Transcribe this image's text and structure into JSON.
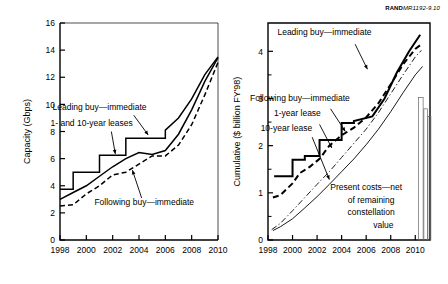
{
  "figure": {
    "credit_brand": "RAND",
    "credit_number": "MR1192-9.10"
  },
  "chart_data": [
    {
      "type": "line",
      "id": "capacity-chart",
      "title": "",
      "xlabel": "",
      "ylabel": "Capacity (Gbps)",
      "xlim": [
        1998,
        2010
      ],
      "ylim": [
        0,
        16
      ],
      "xticks": [
        1998,
        2000,
        2002,
        2004,
        2006,
        2008,
        2010
      ],
      "xtick_labels": [
        "1998",
        "2000",
        "2002",
        "2004",
        "2006",
        "2008",
        "2010"
      ],
      "yticks": [
        0,
        2,
        4,
        6,
        8,
        10,
        12,
        14,
        16
      ],
      "ytick_labels": [
        "0",
        "2",
        "4",
        "6",
        "8",
        "10",
        "12",
        "14",
        "16"
      ],
      "grid": false,
      "legend_position": "inline-annotations",
      "annotations": [
        {
          "text": "Leading buy—immediate",
          "x": 2001.0,
          "y": 9.6
        },
        {
          "text": "1- and 10-year leases",
          "x": 2000.4,
          "y": 8.4
        },
        {
          "text": "Following buy—immediate",
          "x": 2004.4,
          "y": 2.6
        }
      ],
      "series": [
        {
          "name": "Leading buy—immediate",
          "style": "solid-step",
          "x": [
            1998,
            1999,
            1999,
            2001,
            2001,
            2003,
            2003,
            2006,
            2006,
            2007,
            2008,
            2009,
            2010
          ],
          "values": [
            3.75,
            3.75,
            5.0,
            5.0,
            6.25,
            6.25,
            7.5,
            7.5,
            8.1,
            9.0,
            10.4,
            12.2,
            13.5
          ]
        },
        {
          "name": "1- and 10-year leases",
          "style": "solid-smooth",
          "x": [
            1998,
            1999,
            2000,
            2001,
            2002,
            2003,
            2004,
            2005,
            2006,
            2007,
            2008,
            2009,
            2010
          ],
          "values": [
            3.0,
            3.5,
            4.0,
            4.7,
            5.4,
            6.0,
            6.45,
            6.3,
            6.6,
            7.8,
            9.6,
            11.7,
            13.45
          ]
        },
        {
          "name": "Following buy—immediate",
          "style": "dashed-step",
          "x": [
            1998,
            1999,
            2000,
            2001,
            2002,
            2003,
            2003,
            2005,
            2005,
            2006,
            2007,
            2008,
            2009,
            2010
          ],
          "values": [
            2.5,
            2.6,
            3.4,
            4.0,
            4.8,
            5.0,
            5.0,
            6.2,
            6.2,
            6.2,
            7.0,
            8.5,
            10.7,
            13.1
          ]
        }
      ]
    },
    {
      "type": "line",
      "id": "cumulative-cost-chart",
      "title": "",
      "xlabel": "",
      "ylabel": "Cumulative ($ billion FY'98)",
      "xlim": [
        1998,
        2011.2
      ],
      "ylim": [
        0,
        4.6
      ],
      "xticks": [
        1998,
        2000,
        2002,
        2004,
        2006,
        2008,
        2010
      ],
      "xtick_labels": [
        "1998",
        "2000",
        "2002",
        "2004",
        "2006",
        "2008",
        "2010"
      ],
      "yticks": [
        0,
        1,
        2,
        3,
        4
      ],
      "ytick_labels": [
        "0",
        "1",
        "2",
        "3",
        "4"
      ],
      "yticks_minor": [
        0.5,
        1.5,
        2.5,
        3.5
      ],
      "grid": false,
      "legend_position": "inline-annotations",
      "annotations": [
        {
          "text": "Leading buy—immediate",
          "x": 2002.6,
          "y": 4.35
        },
        {
          "text": "Following buy—immediate",
          "x": 2000.6,
          "y": 2.95
        },
        {
          "text": "1-year lease",
          "x": 2000.4,
          "y": 2.62
        },
        {
          "text": "10-year lease",
          "x": 1999.5,
          "y": 2.32
        },
        {
          "text": "Present costs—net",
          "x": 2006.0,
          "y": 1.05
        },
        {
          "text": "of remaining",
          "x": 2006.4,
          "y": 0.78
        },
        {
          "text": "constellation",
          "x": 2006.4,
          "y": 0.52
        },
        {
          "text": "value",
          "x": 2007.4,
          "y": 0.26
        }
      ],
      "series": [
        {
          "name": "Leading buy—immediate",
          "style": "solid-thick-step",
          "x": [
            1998.5,
            2000,
            2000,
            2001,
            2001,
            2002.2,
            2002.2,
            2004,
            2004,
            2005,
            2005,
            2006.5,
            2007.5,
            2008.5,
            2009.5,
            2010.4
          ],
          "values": [
            1.35,
            1.35,
            1.7,
            1.7,
            1.78,
            1.78,
            2.12,
            2.12,
            2.48,
            2.48,
            2.52,
            2.62,
            3.0,
            3.55,
            4.0,
            4.35
          ]
        },
        {
          "name": "Following buy—immediate",
          "style": "dashed-thick",
          "x": [
            1998.4,
            1999,
            2000,
            2000.6,
            2001.4,
            2002.2,
            2003,
            2004,
            2005,
            2006,
            2007,
            2008,
            2009,
            2010,
            2010.5
          ],
          "values": [
            0.9,
            0.95,
            1.2,
            1.42,
            1.55,
            1.72,
            2.0,
            2.22,
            2.38,
            2.6,
            2.9,
            3.3,
            3.72,
            4.05,
            4.15
          ]
        },
        {
          "name": "1-year lease",
          "style": "dash-dot-thin",
          "x": [
            1998.3,
            1999,
            2000,
            2001,
            2002,
            2003,
            2004,
            2005,
            2006,
            2007,
            2008,
            2009,
            2010,
            2010.5
          ],
          "values": [
            0.22,
            0.35,
            0.62,
            0.9,
            1.18,
            1.45,
            1.75,
            2.05,
            2.35,
            2.7,
            3.1,
            3.5,
            3.88,
            4.02
          ]
        },
        {
          "name": "10-year lease",
          "style": "solid-thin",
          "x": [
            1998.4,
            1999,
            2000,
            2001,
            2002,
            2003,
            2004,
            2005,
            2006,
            2007,
            2008,
            2009,
            2010,
            2010.6
          ],
          "values": [
            0.2,
            0.28,
            0.45,
            0.68,
            0.92,
            1.18,
            1.45,
            1.72,
            2.02,
            2.35,
            2.72,
            3.12,
            3.5,
            3.68
          ]
        }
      ],
      "bars": [
        {
          "name": "bar-1",
          "x_center": 2010.45,
          "width": 0.38,
          "bottom": 0.0,
          "top": 3.02
        },
        {
          "name": "bar-2",
          "x_center": 2010.85,
          "width": 0.3,
          "bottom": 0.0,
          "top": 2.78
        },
        {
          "name": "bar-3",
          "x_center": 2011.15,
          "width": 0.24,
          "bottom": 0.0,
          "top": 2.62
        }
      ]
    }
  ]
}
